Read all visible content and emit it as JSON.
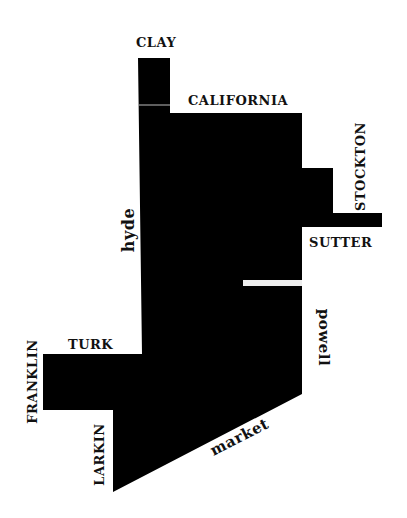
{
  "map": {
    "fill_color": "#000000",
    "background": "#ffffff",
    "streets": {
      "clay": "clay",
      "california": "california",
      "stockton": "stockton",
      "sutter": "sutter",
      "hyde": "hyde",
      "powell": "powell",
      "turk": "turk",
      "franklin": "franklin",
      "larkin": "larkin",
      "market": "market"
    }
  }
}
